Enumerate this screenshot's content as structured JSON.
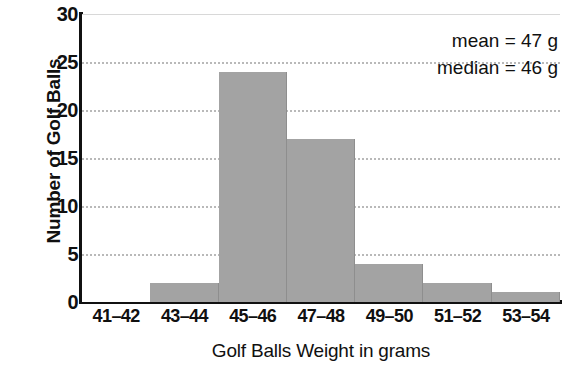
{
  "chart_data": {
    "type": "bar",
    "title": "",
    "subtitle": "",
    "xlabel": "Golf Balls Weight in grams",
    "ylabel": "Number of Golf Balls",
    "categories": [
      "41–42",
      "43–44",
      "45–46",
      "47–48",
      "49–50",
      "51–52",
      "53–54"
    ],
    "values": [
      0,
      2,
      24,
      17,
      4,
      2,
      1
    ],
    "ylim": [
      0,
      30
    ],
    "yticks": [
      0,
      5,
      10,
      15,
      20,
      25,
      30
    ],
    "ytick_labels": [
      "0",
      "5",
      "10",
      "15",
      "20",
      "25",
      "30"
    ],
    "grid": true,
    "grid_axis": "y",
    "legend": false,
    "legend_position": "none",
    "annotations": [
      {
        "label": "mean = 47 g"
      },
      {
        "label": "median = 46 g"
      }
    ],
    "bar_color": "#a3a3a3",
    "axis_color": "#111111",
    "grid_color": "#b9b9b9",
    "text_color": "#101010",
    "background": "#ffffff"
  }
}
